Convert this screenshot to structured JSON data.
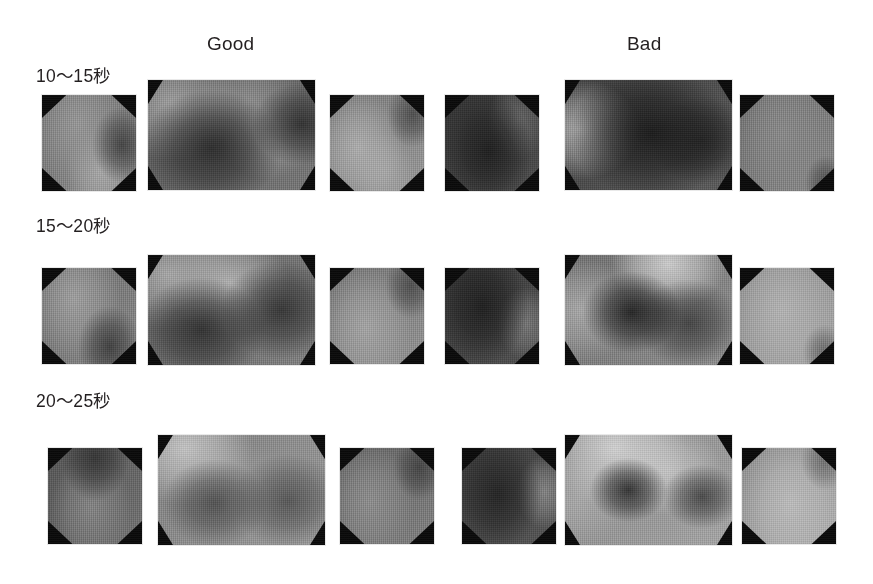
{
  "figure": {
    "background": "#ffffff",
    "column_headers": [
      {
        "label": "Good",
        "x": 207,
        "y": 33
      },
      {
        "label": "Bad",
        "x": 627,
        "y": 33
      }
    ],
    "row_labels": [
      {
        "label": "10〜15秒",
        "x": 36,
        "y": 62
      },
      {
        "label": "15〜20秒",
        "x": 36,
        "y": 212
      },
      {
        "label": "20〜25秒",
        "x": 36,
        "y": 387
      }
    ],
    "panel_shape": "octagon",
    "colormap": "grayscale",
    "panel_border_color": "#0a0a0a"
  },
  "chart_data": {
    "type": "heatmap",
    "title": "",
    "subtitle": "",
    "xlabel": "",
    "ylabel": "",
    "legend_position": "none",
    "grid": false,
    "colormap": "grayscale",
    "value_scale": {
      "min": 0,
      "max": 100,
      "unit": "relative intensity"
    },
    "columns": [
      "Good",
      "Bad"
    ],
    "rows": [
      "10〜15秒",
      "15〜20秒",
      "20〜25秒"
    ],
    "panels_per_cell": [
      "left",
      "center",
      "right"
    ],
    "panels": [
      {
        "row": "10〜15秒",
        "column": "Good",
        "position": "left",
        "shape": "octagon",
        "x": 42,
        "y": 95,
        "w": 94,
        "h": 96,
        "mean_intensity": 52,
        "hotspots": [
          {
            "cx": 38,
            "cy": 30,
            "r": 46,
            "value": 62
          },
          {
            "cx": 62,
            "cy": 78,
            "r": 34,
            "value": 70
          }
        ],
        "coldspots": [
          {
            "cx": 85,
            "cy": 52,
            "r": 30,
            "value": 26
          }
        ]
      },
      {
        "row": "10〜15秒",
        "column": "Good",
        "position": "center",
        "shape": "octagon",
        "x": 148,
        "y": 80,
        "w": 167,
        "h": 110,
        "mean_intensity": 42,
        "hotspots": [
          {
            "cx": 14,
            "cy": 22,
            "r": 38,
            "value": 66
          },
          {
            "cx": 60,
            "cy": 20,
            "r": 30,
            "value": 58
          },
          {
            "cx": 72,
            "cy": 55,
            "r": 26,
            "value": 60
          }
        ],
        "coldspots": [
          {
            "cx": 38,
            "cy": 62,
            "r": 40,
            "value": 16
          },
          {
            "cx": 92,
            "cy": 40,
            "r": 28,
            "value": 18
          }
        ]
      },
      {
        "row": "10〜15秒",
        "column": "Good",
        "position": "right",
        "shape": "octagon",
        "x": 330,
        "y": 95,
        "w": 94,
        "h": 96,
        "mean_intensity": 56,
        "hotspots": [
          {
            "cx": 30,
            "cy": 55,
            "r": 44,
            "value": 72
          },
          {
            "cx": 58,
            "cy": 80,
            "r": 30,
            "value": 68
          }
        ],
        "coldspots": [
          {
            "cx": 88,
            "cy": 20,
            "r": 26,
            "value": 30
          }
        ]
      },
      {
        "row": "10〜15秒",
        "column": "Bad",
        "position": "left",
        "shape": "octagon",
        "x": 445,
        "y": 95,
        "w": 94,
        "h": 96,
        "mean_intensity": 24,
        "hotspots": [
          {
            "cx": 78,
            "cy": 26,
            "r": 30,
            "value": 40
          }
        ],
        "coldspots": [
          {
            "cx": 46,
            "cy": 58,
            "r": 44,
            "value": 10
          }
        ]
      },
      {
        "row": "10〜15秒",
        "column": "Bad",
        "position": "center",
        "shape": "octagon",
        "x": 565,
        "y": 80,
        "w": 167,
        "h": 110,
        "mean_intensity": 30,
        "hotspots": [
          {
            "cx": 8,
            "cy": 45,
            "r": 34,
            "value": 70
          }
        ],
        "coldspots": [
          {
            "cx": 52,
            "cy": 48,
            "r": 46,
            "value": 8
          },
          {
            "cx": 82,
            "cy": 55,
            "r": 30,
            "value": 14
          }
        ]
      },
      {
        "row": "10〜15秒",
        "column": "Bad",
        "position": "right",
        "shape": "octagon",
        "x": 740,
        "y": 95,
        "w": 94,
        "h": 96,
        "mean_intensity": 50,
        "hotspots": [
          {
            "cx": 45,
            "cy": 40,
            "r": 50,
            "value": 56
          }
        ],
        "coldspots": [
          {
            "cx": 92,
            "cy": 92,
            "r": 22,
            "value": 30
          }
        ]
      },
      {
        "row": "15〜20秒",
        "column": "Good",
        "position": "left",
        "shape": "octagon",
        "x": 42,
        "y": 268,
        "w": 94,
        "h": 96,
        "mean_intensity": 50,
        "hotspots": [
          {
            "cx": 34,
            "cy": 32,
            "r": 46,
            "value": 66
          }
        ],
        "coldspots": [
          {
            "cx": 72,
            "cy": 82,
            "r": 32,
            "value": 24
          }
        ]
      },
      {
        "row": "15〜20秒",
        "column": "Good",
        "position": "center",
        "shape": "octagon",
        "x": 148,
        "y": 255,
        "w": 167,
        "h": 110,
        "mean_intensity": 46,
        "hotspots": [
          {
            "cx": 12,
            "cy": 18,
            "r": 36,
            "value": 70
          },
          {
            "cx": 48,
            "cy": 26,
            "r": 34,
            "value": 74
          }
        ],
        "coldspots": [
          {
            "cx": 32,
            "cy": 68,
            "r": 36,
            "value": 18
          },
          {
            "cx": 80,
            "cy": 50,
            "r": 34,
            "value": 20
          }
        ]
      },
      {
        "row": "15〜20秒",
        "column": "Good",
        "position": "right",
        "shape": "octagon",
        "x": 330,
        "y": 268,
        "w": 94,
        "h": 96,
        "mean_intensity": 54,
        "hotspots": [
          {
            "cx": 38,
            "cy": 62,
            "r": 46,
            "value": 68
          }
        ],
        "coldspots": [
          {
            "cx": 86,
            "cy": 18,
            "r": 26,
            "value": 30
          }
        ]
      },
      {
        "row": "15〜20秒",
        "column": "Bad",
        "position": "left",
        "shape": "octagon",
        "x": 445,
        "y": 268,
        "w": 94,
        "h": 96,
        "mean_intensity": 26,
        "hotspots": [
          {
            "cx": 86,
            "cy": 58,
            "r": 28,
            "value": 48
          }
        ],
        "coldspots": [
          {
            "cx": 40,
            "cy": 40,
            "r": 46,
            "value": 10
          }
        ]
      },
      {
        "row": "15〜20秒",
        "column": "Bad",
        "position": "center",
        "shape": "octagon",
        "x": 565,
        "y": 255,
        "w": 167,
        "h": 110,
        "mean_intensity": 52,
        "hotspots": [
          {
            "cx": 62,
            "cy": 8,
            "r": 32,
            "value": 86
          },
          {
            "cx": 10,
            "cy": 50,
            "r": 34,
            "value": 70
          }
        ],
        "coldspots": [
          {
            "cx": 40,
            "cy": 52,
            "r": 28,
            "value": 12
          },
          {
            "cx": 74,
            "cy": 62,
            "r": 30,
            "value": 26
          }
        ]
      },
      {
        "row": "15〜20秒",
        "column": "Bad",
        "position": "right",
        "shape": "octagon",
        "x": 740,
        "y": 268,
        "w": 94,
        "h": 96,
        "mean_intensity": 64,
        "hotspots": [
          {
            "cx": 45,
            "cy": 45,
            "r": 52,
            "value": 74
          }
        ],
        "coldspots": [
          {
            "cx": 90,
            "cy": 88,
            "r": 22,
            "value": 42
          }
        ]
      },
      {
        "row": "20〜25秒",
        "column": "Good",
        "position": "left",
        "shape": "octagon",
        "x": 48,
        "y": 448,
        "w": 94,
        "h": 96,
        "mean_intensity": 40,
        "hotspots": [
          {
            "cx": 46,
            "cy": 62,
            "r": 40,
            "value": 54
          }
        ],
        "coldspots": [
          {
            "cx": 50,
            "cy": 10,
            "r": 34,
            "value": 20
          }
        ]
      },
      {
        "row": "20〜25秒",
        "column": "Good",
        "position": "center",
        "shape": "octagon",
        "x": 158,
        "y": 435,
        "w": 167,
        "h": 110,
        "mean_intensity": 58,
        "hotspots": [
          {
            "cx": 16,
            "cy": 12,
            "r": 38,
            "value": 82
          },
          {
            "cx": 50,
            "cy": 48,
            "r": 30,
            "value": 62
          }
        ],
        "coldspots": [
          {
            "cx": 34,
            "cy": 62,
            "r": 30,
            "value": 32
          },
          {
            "cx": 78,
            "cy": 60,
            "r": 32,
            "value": 34
          }
        ]
      },
      {
        "row": "20〜25秒",
        "column": "Good",
        "position": "right",
        "shape": "octagon",
        "x": 340,
        "y": 448,
        "w": 94,
        "h": 96,
        "mean_intensity": 46,
        "hotspots": [
          {
            "cx": 32,
            "cy": 56,
            "r": 44,
            "value": 58
          }
        ],
        "coldspots": [
          {
            "cx": 84,
            "cy": 20,
            "r": 26,
            "value": 26
          }
        ]
      },
      {
        "row": "20〜25秒",
        "column": "Bad",
        "position": "left",
        "shape": "octagon",
        "x": 462,
        "y": 448,
        "w": 94,
        "h": 96,
        "mean_intensity": 28,
        "hotspots": [
          {
            "cx": 88,
            "cy": 46,
            "r": 28,
            "value": 54
          }
        ],
        "coldspots": [
          {
            "cx": 38,
            "cy": 48,
            "r": 44,
            "value": 12
          }
        ]
      },
      {
        "row": "20〜25秒",
        "column": "Bad",
        "position": "center",
        "shape": "octagon",
        "x": 565,
        "y": 435,
        "w": 167,
        "h": 110,
        "mean_intensity": 62,
        "hotspots": [
          {
            "cx": 30,
            "cy": 12,
            "r": 40,
            "value": 88
          },
          {
            "cx": 62,
            "cy": 32,
            "r": 30,
            "value": 80
          },
          {
            "cx": 8,
            "cy": 60,
            "r": 30,
            "value": 70
          }
        ],
        "coldspots": [
          {
            "cx": 38,
            "cy": 50,
            "r": 22,
            "value": 18
          },
          {
            "cx": 82,
            "cy": 56,
            "r": 22,
            "value": 28
          }
        ]
      },
      {
        "row": "20〜25秒",
        "column": "Bad",
        "position": "right",
        "shape": "octagon",
        "x": 742,
        "y": 448,
        "w": 94,
        "h": 96,
        "mean_intensity": 66,
        "hotspots": [
          {
            "cx": 52,
            "cy": 58,
            "r": 50,
            "value": 78
          }
        ],
        "coldspots": [
          {
            "cx": 88,
            "cy": 12,
            "r": 24,
            "value": 44
          }
        ]
      }
    ]
  }
}
